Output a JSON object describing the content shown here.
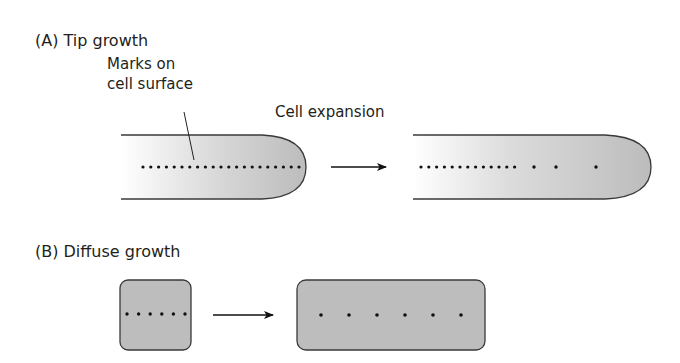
{
  "panel_a": {
    "label": "(A)  Tip growth",
    "annotation_line1": "Marks on",
    "annotation_line2": "cell surface",
    "process_label": "Cell expansion"
  },
  "panel_b": {
    "label": "(B)  Diffuse growth"
  },
  "colors": {
    "outline": "#3a3a3a",
    "cell_fill": "#bdbdbd",
    "cell_fill_light": "#ffffff",
    "dot": "#111111",
    "text": "#231f20"
  },
  "shapes": {
    "tip_before_dots": 21,
    "tip_after_dots_dense": 13,
    "tip_after_dots_sparse": 3,
    "diffuse_before_dots": 6,
    "diffuse_after_dots": 6
  }
}
